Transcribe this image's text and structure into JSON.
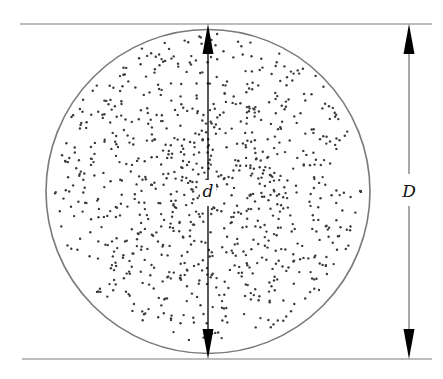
{
  "figure": {
    "type": "diagram",
    "width": 443,
    "height": 379,
    "colors": {
      "background": "#ffffff",
      "circle_stroke": "#7a7a7a",
      "boundary_line": "#7a7a7a",
      "arrow": "#000000",
      "dot": "#3a3a3a",
      "label": "#111111"
    }
  },
  "boundary_lines": {
    "top": {
      "x1": 20,
      "x2": 432,
      "y": 24
    },
    "bottom": {
      "x1": 22,
      "x2": 432,
      "y": 359
    }
  },
  "circle": {
    "cx": 208,
    "cy": 191.5,
    "r": 162
  },
  "dimensions": {
    "inner": {
      "label": "d",
      "x": 208,
      "y_top": 24,
      "y_bottom": 359,
      "label_x": 208,
      "label_y": 197,
      "gap_top": 180,
      "gap_bottom": 206
    },
    "outer": {
      "label": "D",
      "x": 409,
      "y_top": 24,
      "y_bottom": 359,
      "label_x": 409,
      "label_y": 197,
      "gap_top": 174,
      "gap_bottom": 206
    }
  },
  "particles": {
    "count": 900,
    "seed": 7,
    "dot_radius": 1.2,
    "concentration_bias": 0.62
  }
}
